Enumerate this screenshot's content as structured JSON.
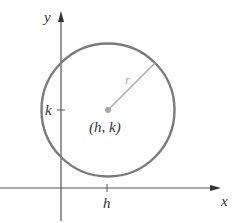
{
  "diagram": {
    "labels": {
      "x_axis": "x",
      "y_axis": "y",
      "h_tick": "h",
      "k_tick": "k",
      "center": "(h, k)",
      "radius": "r"
    },
    "colors": {
      "circle": "#7a7a7a",
      "radius_line": "#a8a8a8",
      "center_dot": "#a8a8a8",
      "axes": "#555555",
      "text": "#333333"
    }
  }
}
